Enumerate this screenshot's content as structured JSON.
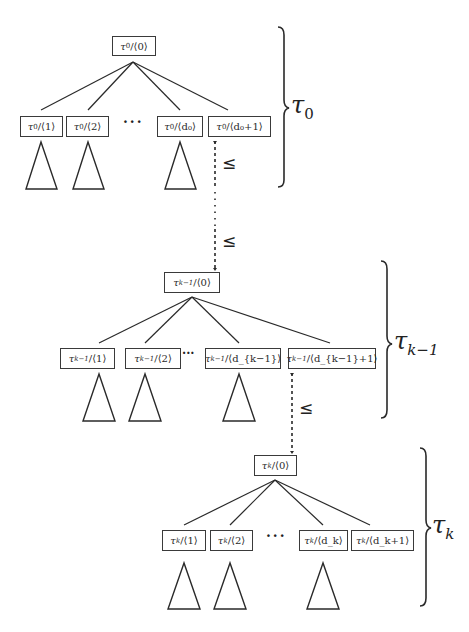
{
  "diagram": {
    "colors": {
      "stroke": "#2a2a2a",
      "background": "#ffffff"
    },
    "relation_symbol": "≤",
    "ellipsis": "···",
    "levels": [
      {
        "id": "tau0",
        "group_label": {
          "base": "τ",
          "sub": "0"
        },
        "root": {
          "tau": "τ",
          "sub": "0",
          "arg": "/⟨0⟩"
        },
        "children": [
          {
            "tau": "τ",
            "sub": "0",
            "arg": "/⟨1⟩"
          },
          {
            "tau": "τ",
            "sub": "0",
            "arg": "/⟨2⟩"
          },
          {
            "tau": "τ",
            "sub": "0",
            "arg": "/⟨d₀⟩"
          },
          {
            "tau": "τ",
            "sub": "0",
            "arg": "/⟨d₀+1⟩"
          }
        ]
      },
      {
        "id": "tauk-1",
        "group_label": {
          "base": "τ",
          "sub": "k−1"
        },
        "root": {
          "tau": "τ",
          "sub": "k−1",
          "arg": "/⟨0⟩"
        },
        "children": [
          {
            "tau": "τ",
            "sub": "k−1",
            "arg": "/⟨1⟩"
          },
          {
            "tau": "τ",
            "sub": "k−1",
            "arg": "/⟨2⟩"
          },
          {
            "tau": "τ",
            "sub": "k−1",
            "arg": "/⟨d_{k−1}⟩"
          },
          {
            "tau": "τ",
            "sub": "k−1",
            "arg": "/⟨d_{k−1}+1⟩"
          }
        ]
      },
      {
        "id": "tauk",
        "group_label": {
          "base": "τ",
          "sub": "k"
        },
        "root": {
          "tau": "τ",
          "sub": "k",
          "arg": "/⟨0⟩"
        },
        "children": [
          {
            "tau": "τ",
            "sub": "k",
            "arg": "/⟨1⟩"
          },
          {
            "tau": "τ",
            "sub": "k",
            "arg": "/⟨2⟩"
          },
          {
            "tau": "τ",
            "sub": "k",
            "arg": "/⟨d_k⟩"
          },
          {
            "tau": "τ",
            "sub": "k",
            "arg": "/⟨d_k+1⟩"
          }
        ]
      }
    ],
    "connectors": [
      {
        "from": "tau0/⟨d₀+1⟩",
        "to": "tau_{k-1}/⟨0⟩",
        "style": "dashed-dotted",
        "labels": [
          "≤",
          "≤"
        ]
      },
      {
        "from": "tau_{k-1}/⟨d_{k-1}+1⟩",
        "to": "tau_k/⟨0⟩",
        "style": "dashed",
        "labels": [
          "≤"
        ]
      }
    ]
  }
}
